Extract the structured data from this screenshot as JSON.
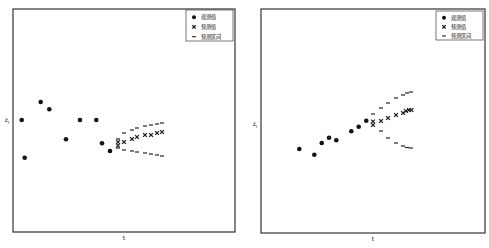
{
  "chart_data": [
    {
      "type": "scatter",
      "title": "",
      "xlabel": "t",
      "ylabel": "z_t",
      "grid": false,
      "legend_position": "upper right",
      "legend": [
        "观测值",
        "预测值",
        "预测区间"
      ],
      "series": [
        {
          "name": "观测值",
          "marker": "circle",
          "x": [
            1,
            2,
            3,
            4,
            5,
            6,
            7,
            8,
            9
          ],
          "y": [
            0.0,
            -1.1,
            0.55,
            0.33,
            -0.57,
            0.0,
            0.0,
            -0.7,
            -0.92
          ]
        },
        {
          "name": "预测值",
          "marker": "x",
          "x": [
            10,
            10,
            11,
            12,
            13,
            14,
            15,
            16,
            17
          ],
          "y": [
            -0.66,
            -0.75,
            -0.66,
            -0.57,
            -0.5,
            -0.45,
            -0.45,
            -0.38,
            -0.35
          ]
        },
        {
          "name": "预测区间",
          "marker": "dash",
          "x": [
            10,
            11,
            12,
            13,
            14,
            15,
            16,
            17,
            10,
            11,
            12,
            13,
            14,
            15,
            16,
            17
          ],
          "y": [
            -0.62,
            -0.4,
            -0.3,
            -0.24,
            -0.18,
            -0.15,
            -0.12,
            -0.09,
            -0.84,
            -0.9,
            -0.93,
            -0.96,
            -0.99,
            -1.02,
            -1.05,
            -1.08
          ]
        }
      ]
    },
    {
      "type": "scatter",
      "title": "",
      "xlabel": "t",
      "ylabel": "z_t",
      "grid": false,
      "legend_position": "upper right",
      "legend": [
        "观测值",
        "预测值",
        "预测区间"
      ],
      "series": [
        {
          "name": "观测值",
          "marker": "circle",
          "x": [
            1,
            2,
            3,
            4,
            5,
            6,
            7,
            8
          ],
          "y": [
            -0.75,
            -0.92,
            -0.57,
            -0.41,
            -0.49,
            -0.22,
            -0.08,
            0.08
          ]
        },
        {
          "name": "预测值",
          "marker": "x",
          "x": [
            9,
            9,
            10,
            11,
            12,
            13,
            14,
            15,
            16
          ],
          "y": [
            0.02,
            -0.08,
            0.05,
            0.15,
            0.25,
            0.3,
            0.36,
            0.39,
            0.39
          ]
        },
        {
          "name": "预测区间",
          "marker": "dash",
          "x": [
            9,
            10,
            11,
            12,
            13,
            14,
            15,
            9,
            10,
            11,
            12,
            13,
            14,
            15
          ],
          "y": [
            0.25,
            0.45,
            0.6,
            0.75,
            0.85,
            0.91,
            0.94,
            -0.25,
            -0.25,
            -0.46,
            -0.61,
            -0.7,
            -0.73,
            -0.76
          ]
        }
      ]
    }
  ],
  "panels": [
    {
      "frame": {
        "x": 13,
        "y": 9,
        "w": 222,
        "h": 223
      },
      "xlabel": "t",
      "ylabel": "z",
      "ylabel_sub": "t",
      "xlabel_pos": {
        "x": 124,
        "y": 240
      },
      "ylabel_pos": {
        "x": 7,
        "y": 122
      },
      "legend": {
        "box": {
          "x": 186,
          "y": 10,
          "w": 47,
          "h": 31
        },
        "items": [
          {
            "label": "观测值",
            "marker": "circle"
          },
          {
            "label": "预测值",
            "marker": "x"
          },
          {
            "label": "预测区间",
            "marker": "dash"
          }
        ]
      },
      "observed_px": [
        [
          21.7,
          120
        ],
        [
          24.7,
          157.7
        ],
        [
          40.7,
          102
        ],
        [
          49.3,
          109.3
        ],
        [
          66,
          139.3
        ],
        [
          80,
          120
        ],
        [
          96.3,
          120
        ],
        [
          102,
          143.3
        ],
        [
          110,
          151
        ]
      ],
      "forecast_px": [
        [
          118,
          142
        ],
        [
          118,
          145.5
        ],
        [
          124,
          142
        ],
        [
          132,
          139
        ],
        [
          137,
          137
        ],
        [
          145,
          135
        ],
        [
          151,
          135
        ],
        [
          157,
          133
        ],
        [
          162,
          132
        ]
      ],
      "upper_px": [
        [
          118,
          139
        ],
        [
          124,
          133
        ],
        [
          132,
          130
        ],
        [
          137,
          128
        ],
        [
          145,
          126
        ],
        [
          151,
          125
        ],
        [
          157,
          124
        ],
        [
          162,
          123
        ]
      ],
      "lower_px": [
        [
          118,
          148
        ],
        [
          124,
          150
        ],
        [
          132,
          151
        ],
        [
          137,
          152
        ],
        [
          145,
          153
        ],
        [
          151,
          154
        ],
        [
          157,
          155
        ],
        [
          162,
          156
        ]
      ]
    },
    {
      "frame": {
        "x": 261,
        "y": 9,
        "w": 224,
        "h": 224
      },
      "xlabel": "t",
      "ylabel": "z",
      "ylabel_sub": "t",
      "xlabel_pos": {
        "x": 373,
        "y": 241
      },
      "ylabel_pos": {
        "x": 255,
        "y": 126
      },
      "legend": {
        "box": {
          "x": 436,
          "y": 11,
          "w": 47,
          "h": 29
        },
        "items": [
          {
            "label": "观测值",
            "marker": "circle"
          },
          {
            "label": "预测值",
            "marker": "x"
          },
          {
            "label": "预测区间",
            "marker": "dash"
          }
        ]
      },
      "observed_px": [
        [
          299.3,
          149
        ],
        [
          314.3,
          154.7
        ],
        [
          321.7,
          143
        ],
        [
          329,
          137.7
        ],
        [
          336.3,
          140.3
        ],
        [
          351.3,
          131.3
        ],
        [
          358.7,
          126.7
        ],
        [
          366.3,
          120.7
        ]
      ],
      "forecast_px": [
        [
          373,
          121.5
        ],
        [
          373,
          125
        ],
        [
          381,
          121
        ],
        [
          388,
          118
        ],
        [
          396,
          115
        ],
        [
          403,
          113
        ],
        [
          406,
          111
        ],
        [
          409,
          110
        ],
        [
          411.5,
          110
        ]
      ],
      "upper_px": [
        [
          373,
          114
        ],
        [
          381,
          108
        ],
        [
          388,
          103
        ],
        [
          396,
          98
        ],
        [
          403,
          95
        ],
        [
          407,
          93
        ],
        [
          411,
          92
        ]
      ],
      "lower_px": [
        [
          381,
          131
        ],
        [
          388,
          138
        ],
        [
          396,
          143
        ],
        [
          403,
          146
        ],
        [
          407,
          147.5
        ],
        [
          411,
          148
        ]
      ]
    }
  ]
}
